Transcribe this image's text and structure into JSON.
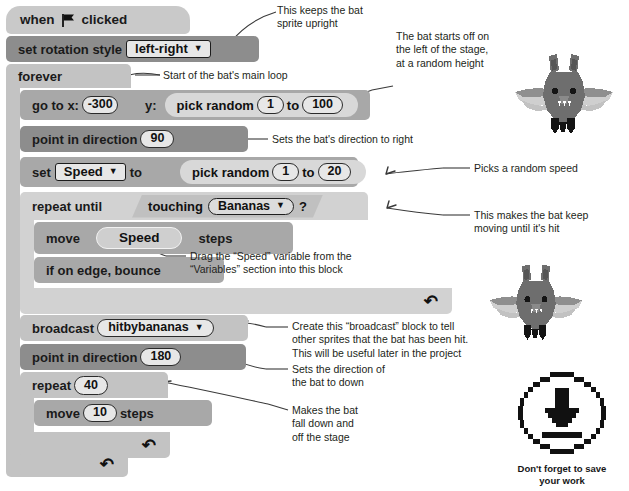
{
  "script": {
    "hat": {
      "text_before": "when",
      "flag_icon": "green-flag-icon",
      "text_after": "clicked"
    },
    "set_rotation": {
      "label": "set rotation style",
      "value": "left-right",
      "caret": "▼"
    },
    "forever": {
      "label": "forever"
    },
    "goto": {
      "label_x": "go to x:",
      "x_value": "-300",
      "label_y": "y:",
      "pick_label": "pick random",
      "from": "1",
      "to_label": "to",
      "to": "100"
    },
    "point90": {
      "label": "point in direction",
      "value": "90"
    },
    "set_speed": {
      "label_set": "set",
      "variable": "Speed",
      "caret": "▼",
      "label_to": "to",
      "pick_label": "pick random",
      "from": "1",
      "to_label": "to",
      "to": "20"
    },
    "repeat_until": {
      "label": "repeat until",
      "touching_label": "touching",
      "target": "Bananas",
      "caret": "▼",
      "question": "?"
    },
    "move_speed": {
      "label_move": "move",
      "variable": "Speed",
      "label_steps": "steps"
    },
    "bounce": {
      "label": "if on edge, bounce"
    },
    "broadcast": {
      "label": "broadcast",
      "message": "hitbybananas",
      "caret": "▼"
    },
    "point180": {
      "label": "point in direction",
      "value": "180"
    },
    "repeat": {
      "label": "repeat",
      "value": "40"
    },
    "move10": {
      "label_move": "move",
      "value": "10",
      "label_steps": "steps"
    },
    "loop_arrow": "↷"
  },
  "annotations": [
    {
      "id": "note-upright",
      "text": "This keeps the bat\nsprite upright"
    },
    {
      "id": "note-main-loop",
      "text": "Start of the bat's main loop"
    },
    {
      "id": "note-start-left",
      "text": "The bat starts off on\nthe left of the stage,\nat a random height"
    },
    {
      "id": "note-direction-right",
      "text": "Sets the bat's direction to right"
    },
    {
      "id": "note-random-speed",
      "text": "Picks a random speed"
    },
    {
      "id": "note-keep-moving",
      "text": "This makes the bat keep\nmoving until it's hit"
    },
    {
      "id": "note-drag-speed",
      "text": "Drag the “Speed” variable from the\n“Variables” section into this block"
    },
    {
      "id": "note-broadcast",
      "text": "Create this “broadcast” block to tell\nother sprites that the bat has been hit.\nThis will be useful later in the project"
    },
    {
      "id": "note-direction-down",
      "text": "Sets the direction of\nthe bat to down"
    },
    {
      "id": "note-fall-down",
      "text": "Makes the bat\nfall down and\noff the stage"
    }
  ],
  "sprites": {
    "bat_top": "bat-sprite-icon",
    "bat_bottom": "bat-sprite-icon"
  },
  "save_reminder": {
    "icon": "download-save-icon",
    "caption": "Don't forget to save\nyour work"
  },
  "colors": {
    "block_dark": "#8d8d8d",
    "block_mid": "#a8a8a8",
    "block_light": "#c3c3c3",
    "block_lighter": "#d2d2d2",
    "hat": "#c9c9c9",
    "text": "#1a1a1a",
    "annotation_text": "#231f20",
    "background": "#ffffff"
  }
}
